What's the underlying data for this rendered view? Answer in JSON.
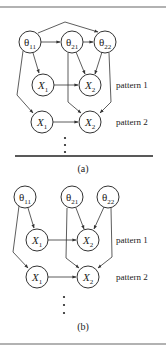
{
  "figure": {
    "panels": [
      {
        "id": "a",
        "caption": "(a)",
        "theta_nodes": [
          {
            "label": "θ",
            "sub": "11"
          },
          {
            "label": "θ",
            "sub": "21"
          },
          {
            "label": "θ",
            "sub": "22"
          }
        ],
        "x_nodes": [
          {
            "label": "X",
            "sub": "1"
          },
          {
            "label": "X",
            "sub": "2"
          },
          {
            "label": "X",
            "sub": "1"
          },
          {
            "label": "X",
            "sub": "2"
          }
        ],
        "patterns": [
          "pattern 1",
          "pattern 2"
        ],
        "continuation": "⋮"
      },
      {
        "id": "b",
        "caption": "(b)",
        "theta_nodes": [
          {
            "label": "θ",
            "sub": "11"
          },
          {
            "label": "θ",
            "sub": "21"
          },
          {
            "label": "θ",
            "sub": "22"
          }
        ],
        "x_nodes": [
          {
            "label": "X",
            "sub": "1"
          },
          {
            "label": "X",
            "sub": "2"
          },
          {
            "label": "X",
            "sub": "1"
          },
          {
            "label": "X",
            "sub": "2"
          }
        ],
        "patterns": [
          "pattern 1",
          "pattern 2"
        ],
        "continuation": "⋮"
      }
    ]
  }
}
